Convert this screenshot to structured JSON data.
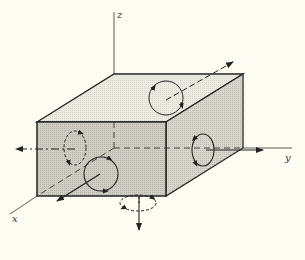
{
  "diagram": {
    "axes": {
      "x": "x",
      "y": "y",
      "z": "z"
    },
    "colors": {
      "background": "#fdfcf2",
      "front_face": "#cfcdc4",
      "right_face": "#d8d6cd",
      "top_face": "#ecebe2",
      "stroke": "#222222"
    },
    "faces": [
      {
        "name": "front",
        "normal": "+x",
        "loop": "solid"
      },
      {
        "name": "back",
        "normal": "-x",
        "loop": "dashed"
      },
      {
        "name": "right",
        "normal": "+y",
        "loop": "solid"
      },
      {
        "name": "left",
        "normal": "-y",
        "loop": "dashed"
      },
      {
        "name": "top",
        "normal": "+z",
        "loop": "solid"
      },
      {
        "name": "bottom",
        "normal": "-z",
        "loop": "dashed"
      }
    ]
  }
}
